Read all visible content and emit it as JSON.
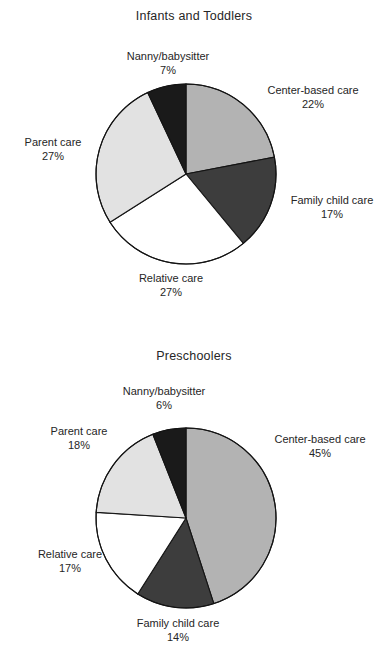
{
  "document": {
    "background": "#ffffff",
    "width": 388,
    "height": 663
  },
  "palette": {
    "center_based": "#b3b3b3",
    "family_child": "#3d3d3d",
    "relative": "#ffffff",
    "parent": "#e2e2e2",
    "nanny": "#1a1a1a",
    "outline": "#141414",
    "text": "#262626"
  },
  "charts": [
    {
      "id": "infants-and-toddlers",
      "title": "Infants and Toddlers",
      "center": {
        "x": 186,
        "y": 174
      },
      "radius": 90,
      "labels": [
        {
          "name": "Nanny/babysitter",
          "pct": "7%",
          "x": 104,
          "y": 50,
          "width": 128,
          "align": "align-center"
        },
        {
          "name": "Center-based care",
          "pct": "22%",
          "x": 252,
          "y": 84,
          "width": 122,
          "align": "align-center"
        },
        {
          "name": "Family child care",
          "pct": "17%",
          "x": 276,
          "y": 194,
          "width": 112,
          "align": "align-center"
        },
        {
          "name": "Relative care",
          "pct": "27%",
          "x": 121,
          "y": 272,
          "width": 100,
          "align": "align-center"
        },
        {
          "name": "Parent care",
          "pct": "27%",
          "x": 8,
          "y": 136,
          "width": 90,
          "align": "align-center"
        }
      ]
    },
    {
      "id": "preschoolers",
      "title": "Preschoolers",
      "center": {
        "x": 186,
        "y": 188
      },
      "radius": 90,
      "labels": [
        {
          "name": "Nanny/babysitter",
          "pct": "6%",
          "x": 100,
          "y": 55,
          "width": 128,
          "align": "align-center"
        },
        {
          "name": "Center-based care",
          "pct": "45%",
          "x": 258,
          "y": 103,
          "width": 124,
          "align": "align-center"
        },
        {
          "name": "Family child care",
          "pct": "14%",
          "x": 114,
          "y": 287,
          "width": 128,
          "align": "align-center"
        },
        {
          "name": "Relative care",
          "pct": "17%",
          "x": 22,
          "y": 218,
          "width": 96,
          "align": "align-center"
        },
        {
          "name": "Parent care",
          "pct": "18%",
          "x": 32,
          "y": 95,
          "width": 94,
          "align": "align-center"
        }
      ]
    }
  ],
  "chart_data": [
    {
      "type": "pie",
      "title": "Infants and Toddlers",
      "xlabel": "",
      "ylabel": "",
      "legend_position": "none",
      "grid": false,
      "units": "percent",
      "start_angle_deg": 0,
      "direction": "clockwise",
      "categories": [
        "Center-based care",
        "Family child care",
        "Relative care",
        "Parent care",
        "Nanny/babysitter"
      ],
      "values": [
        22,
        17,
        27,
        27,
        7
      ],
      "labels": [
        "22%",
        "17%",
        "27%",
        "27%",
        "7%"
      ],
      "colors": [
        "#b3b3b3",
        "#3d3d3d",
        "#ffffff",
        "#e2e2e2",
        "#1a1a1a"
      ]
    },
    {
      "type": "pie",
      "title": "Preschoolers",
      "xlabel": "",
      "ylabel": "",
      "legend_position": "none",
      "grid": false,
      "units": "percent",
      "start_angle_deg": 0,
      "direction": "clockwise",
      "categories": [
        "Center-based care",
        "Family child care",
        "Relative care",
        "Parent care",
        "Nanny/babysitter"
      ],
      "values": [
        45,
        14,
        17,
        18,
        6
      ],
      "labels": [
        "45%",
        "14%",
        "17%",
        "18%",
        "6%"
      ],
      "colors": [
        "#b3b3b3",
        "#3d3d3d",
        "#ffffff",
        "#e2e2e2",
        "#1a1a1a"
      ]
    }
  ]
}
